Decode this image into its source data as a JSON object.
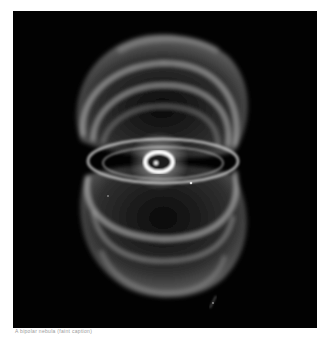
{
  "image": {
    "subject": "bipolar hourglass-shaped nebula with bright central ring and star",
    "background_color": "#020202",
    "nebula_color": "#d8d8d8",
    "ring_color": "#ffffff"
  },
  "caption": {
    "text": "A bipolar nebula (faint caption)"
  }
}
